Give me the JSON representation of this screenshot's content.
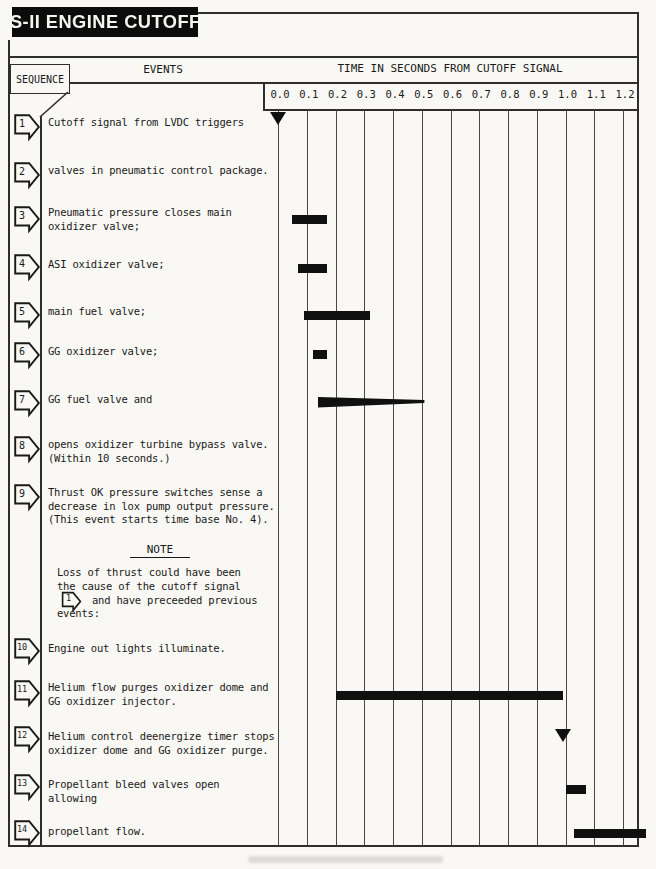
{
  "title": "S-II ENGINE CUTOFF",
  "header": {
    "sequence": "SEQUENCE",
    "events": "EVENTS",
    "time": "TIME IN SECONDS FROM CUTOFF SIGNAL"
  },
  "axis": {
    "ticks": [
      "0.0",
      "0.1",
      "0.2",
      "0.3",
      "0.4",
      "0.5",
      "0.6",
      "0.7",
      "0.8",
      "0.9",
      "1.0",
      "1.1",
      "1.2"
    ],
    "unit": "seconds"
  },
  "events": [
    {
      "num": "1",
      "lines": [
        "Cutoff signal from LVDC triggers"
      ]
    },
    {
      "num": "2",
      "lines": [
        "valves in pneumatic control package."
      ]
    },
    {
      "num": "3",
      "lines": [
        "Pneumatic pressure closes main",
        "oxidizer valve;"
      ]
    },
    {
      "num": "4",
      "lines": [
        "ASI oxidizer valve;"
      ]
    },
    {
      "num": "5",
      "lines": [
        "main fuel valve;"
      ]
    },
    {
      "num": "6",
      "lines": [
        "GG oxidizer valve;"
      ]
    },
    {
      "num": "7",
      "lines": [
        "GG fuel valve and"
      ]
    },
    {
      "num": "8",
      "lines": [
        "opens oxidizer turbine bypass valve.",
        "(Within 10 seconds.)"
      ]
    },
    {
      "num": "9",
      "lines": [
        "Thrust OK pressure switches sense a",
        "decrease in lox pump output pressure.",
        "(This event starts time base No. 4)."
      ]
    },
    {
      "num": "10",
      "lines": [
        "Engine out lights illuminate."
      ]
    },
    {
      "num": "11",
      "lines": [
        "Helium flow purges oxidizer dome and",
        "GG oxidizer injector."
      ]
    },
    {
      "num": "12",
      "lines": [
        "Helium control deenergize timer stops",
        "oxidizer dome and GG oxidizer purge."
      ]
    },
    {
      "num": "13",
      "lines": [
        "Propellant bleed valves open",
        "allowing"
      ]
    },
    {
      "num": "14",
      "lines": [
        "propellant flow."
      ]
    }
  ],
  "note": {
    "title": "NOTE",
    "badge": "1",
    "lines": [
      "Loss of thrust could have been",
      "the cause of the cutoff signal",
      "and have preceeded previous",
      "events:"
    ]
  },
  "chart_data": {
    "type": "timeline",
    "xlabel": "TIME IN SECONDS FROM CUTOFF SIGNAL",
    "xlim": [
      0.0,
      1.2
    ],
    "tick_interval": 0.1,
    "markers": [
      {
        "event": 1,
        "type": "instant",
        "t": 0.0
      },
      {
        "event": 3,
        "type": "bar",
        "start": 0.05,
        "end": 0.17
      },
      {
        "event": 4,
        "type": "bar",
        "start": 0.07,
        "end": 0.17
      },
      {
        "event": 5,
        "type": "bar",
        "start": 0.09,
        "end": 0.32
      },
      {
        "event": 6,
        "type": "bar",
        "start": 0.12,
        "end": 0.17
      },
      {
        "event": 7,
        "type": "wedge",
        "start": 0.14,
        "end": 0.51
      },
      {
        "event": 11,
        "type": "bar",
        "start": 0.2,
        "end": 0.99
      },
      {
        "event": 12,
        "type": "instant",
        "t": 0.99
      },
      {
        "event": 13,
        "type": "bar",
        "start": 1.0,
        "end": 1.07
      },
      {
        "event": 14,
        "type": "bar",
        "start": 1.03,
        "end": 1.28
      }
    ],
    "colors": {
      "ink": "#191919",
      "paper": "#f9f8f4",
      "bar": "#101010"
    }
  }
}
